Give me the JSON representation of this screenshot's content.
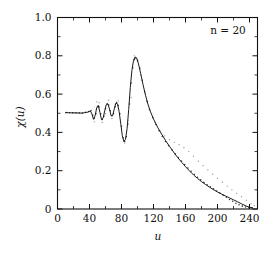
{
  "figure": {
    "background_color": "#ffffff",
    "foreground_color": "#111111",
    "width": 276,
    "height": 256
  },
  "chart_data": {
    "type": "line",
    "title": "",
    "subtitle": "",
    "xlabel": "u",
    "ylabel": "χ(u)",
    "xlim": [
      0,
      250
    ],
    "ylim": [
      0.0,
      1.0
    ],
    "grid": false,
    "legend_position": "none",
    "annotations": [
      {
        "text": "n = 20",
        "x": 210,
        "y": 0.93
      }
    ],
    "xticks": [
      0,
      40,
      80,
      120,
      160,
      200,
      240
    ],
    "xticklabels": [
      "0",
      "40",
      "80",
      "120",
      "160",
      "200",
      "240"
    ],
    "xticks_minor": [
      20,
      60,
      100,
      140,
      180,
      220
    ],
    "yticks": [
      0.0,
      0.2,
      0.4,
      0.6,
      0.8,
      1.0
    ],
    "yticklabels": [
      "0",
      "0.2",
      "0.4",
      "0.6",
      "0.8",
      "1.0"
    ],
    "yticks_minor": [
      0.1,
      0.3,
      0.5,
      0.7,
      0.9
    ],
    "series": [
      {
        "name": "chi-theory-curve",
        "style": "solid-line",
        "color": "#1b1b1b",
        "x": [
          10,
          14,
          18,
          22,
          26,
          30,
          34,
          38,
          41,
          43,
          45,
          47,
          49,
          51,
          53,
          55,
          57,
          59,
          61,
          63,
          65,
          67,
          69,
          71,
          73,
          75,
          77,
          79,
          81,
          83,
          85,
          87,
          89,
          91,
          93,
          95,
          97,
          99,
          101,
          104,
          107,
          110,
          113,
          116,
          120,
          125,
          130,
          135,
          140,
          145,
          150,
          155,
          160,
          165,
          170,
          175,
          180,
          185,
          190,
          195,
          200,
          205,
          210,
          215,
          220,
          225,
          230,
          235,
          240,
          244
        ],
        "y": [
          0.503,
          0.503,
          0.502,
          0.502,
          0.501,
          0.501,
          0.503,
          0.506,
          0.512,
          0.497,
          0.468,
          0.487,
          0.528,
          0.541,
          0.505,
          0.466,
          0.474,
          0.512,
          0.545,
          0.549,
          0.522,
          0.487,
          0.488,
          0.523,
          0.553,
          0.549,
          0.51,
          0.448,
          0.383,
          0.352,
          0.364,
          0.42,
          0.519,
          0.635,
          0.724,
          0.775,
          0.794,
          0.788,
          0.762,
          0.707,
          0.648,
          0.594,
          0.548,
          0.51,
          0.47,
          0.428,
          0.392,
          0.358,
          0.327,
          0.298,
          0.27,
          0.245,
          0.221,
          0.199,
          0.178,
          0.16,
          0.143,
          0.128,
          0.114,
          0.101,
          0.089,
          0.078,
          0.068,
          0.058,
          0.048,
          0.038,
          0.027,
          0.017,
          0.009,
          0.006
        ]
      },
      {
        "name": "chi-simulation-points",
        "style": "scatter-dots",
        "color": "#3a3a3a",
        "x": [
          11,
          15,
          19,
          23,
          27,
          31,
          35,
          39,
          42,
          44,
          46,
          48,
          50,
          52,
          54,
          56,
          58,
          60,
          62,
          64,
          66,
          68,
          70,
          72,
          74,
          76,
          78,
          80,
          82,
          84,
          86,
          88,
          90,
          92,
          94,
          96,
          98,
          100,
          103,
          106,
          109,
          112,
          115,
          119,
          123,
          127,
          131,
          135,
          139,
          143,
          147,
          151,
          155,
          159,
          163,
          167,
          171,
          175,
          179,
          183,
          187,
          191,
          195,
          199,
          203,
          207,
          211,
          215,
          219,
          223,
          227,
          231,
          235,
          239,
          243
        ],
        "y": [
          0.504,
          0.503,
          0.502,
          0.503,
          0.502,
          0.5,
          0.505,
          0.509,
          0.514,
          0.49,
          0.474,
          0.498,
          0.535,
          0.533,
          0.497,
          0.468,
          0.484,
          0.523,
          0.549,
          0.543,
          0.513,
          0.487,
          0.497,
          0.534,
          0.556,
          0.54,
          0.497,
          0.432,
          0.372,
          0.352,
          0.377,
          0.444,
          0.548,
          0.658,
          0.738,
          0.78,
          0.788,
          0.776,
          0.735,
          0.672,
          0.612,
          0.562,
          0.521,
          0.478,
          0.441,
          0.408,
          0.379,
          0.352,
          0.33,
          0.309,
          0.288,
          0.269,
          0.251,
          0.232,
          0.214,
          0.197,
          0.181,
          0.166,
          0.152,
          0.139,
          0.127,
          0.116,
          0.105,
          0.094,
          0.083,
          0.072,
          0.061,
          0.05,
          0.04,
          0.03,
          0.022,
          0.015,
          0.01,
          0.007,
          0.006
        ]
      },
      {
        "name": "chi-scatter-upper-spread",
        "style": "scatter-dots-faint",
        "color": "#8a8a8a",
        "x": [
          46,
          49,
          52,
          56,
          60,
          64,
          68,
          72,
          76,
          80,
          84,
          88,
          92,
          96,
          100,
          104,
          110,
          116,
          122,
          128,
          134,
          140,
          146,
          152,
          158,
          164,
          170,
          176,
          182,
          188,
          194,
          200,
          206,
          212,
          218,
          224,
          230,
          236,
          242,
          246
        ],
        "y": [
          0.455,
          0.56,
          0.555,
          0.452,
          0.498,
          0.568,
          0.472,
          0.548,
          0.565,
          0.418,
          0.344,
          0.462,
          0.582,
          0.8,
          0.77,
          0.7,
          0.6,
          0.512,
          0.452,
          0.41,
          0.382,
          0.362,
          0.348,
          0.336,
          0.32,
          0.3,
          0.276,
          0.25,
          0.226,
          0.204,
          0.182,
          0.16,
          0.14,
          0.12,
          0.1,
          0.082,
          0.064,
          0.046,
          0.028,
          0.018
        ]
      }
    ]
  }
}
